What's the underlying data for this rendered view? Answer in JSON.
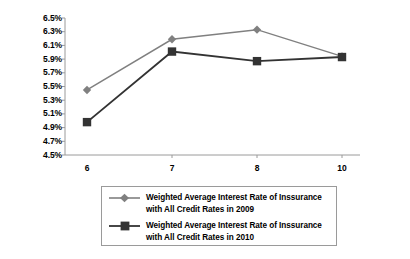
{
  "chart_data": {
    "type": "line",
    "title": "",
    "subtitle": "",
    "xlabel": "",
    "ylabel": "",
    "categories": [
      "6",
      "7",
      "8",
      "10"
    ],
    "x_tick_labels": [
      "6",
      "7",
      "8",
      "10"
    ],
    "y_tick_labels": [
      "6.5%",
      "6.3%",
      "6.1%",
      "5.9%",
      "5.7%",
      "5.5%",
      "5.3%",
      "5.1%",
      "4.9%",
      "4.7%",
      "4.5%"
    ],
    "y_tick_values": [
      6.5,
      6.3,
      6.1,
      5.9,
      5.7,
      5.5,
      5.3,
      5.1,
      4.9,
      4.7,
      4.5
    ],
    "ylim": [
      4.5,
      6.5
    ],
    "y_tick_step": 0.2,
    "grid": false,
    "legend_position": "bottom",
    "series": [
      {
        "name": "Weighted Average Interest Rate of Inssurance with All Credit Rates in 2009",
        "values": [
          5.45,
          6.19,
          6.33,
          5.94
        ],
        "color": "#808080",
        "marker": "diamond"
      },
      {
        "name": "Weighted Average Interest Rate of Inssurance with All Credit Rates in 2010",
        "values": [
          4.98,
          6.01,
          5.87,
          5.93
        ],
        "color": "#333333",
        "marker": "square"
      }
    ]
  },
  "legend": {
    "items": [
      {
        "label": "Weighted Average Interest Rate of Inssurance\nwith All Credit Rates in 2009",
        "color": "#808080",
        "marker": "diamond"
      },
      {
        "label": "Weighted Average Interest Rate of Inssurance\nwith All Credit Rates in 2010",
        "color": "#333333",
        "marker": "square"
      }
    ]
  },
  "axes": {
    "axis_color": "#9a9a9a",
    "tick_color": "#9a9a9a",
    "label_color": "#000000"
  }
}
